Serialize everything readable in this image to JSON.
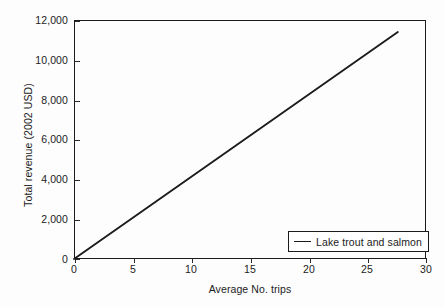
{
  "chart_data": {
    "type": "line",
    "title": "",
    "xlabel": "Average No. trips",
    "ylabel": "Total revenue (2002 USD)",
    "xlim": [
      0,
      30
    ],
    "ylim": [
      0,
      12000
    ],
    "xticks": [
      0,
      5,
      10,
      15,
      20,
      25,
      30
    ],
    "xtick_labels": [
      "0",
      "5",
      "10",
      "15",
      "20",
      "25",
      "30"
    ],
    "yticks": [
      0,
      2000,
      4000,
      6000,
      8000,
      10000,
      12000
    ],
    "ytick_labels": [
      "0",
      "2,000",
      "4,000",
      "6,000",
      "8,000",
      "10,000",
      "12,000"
    ],
    "grid": false,
    "legend_position": "lower right",
    "series": [
      {
        "name": "Lake trout and salmon",
        "color": "#1b1b1b",
        "x": [
          0,
          27.6
        ],
        "y": [
          0,
          11400
        ]
      }
    ]
  },
  "legend": {
    "entries": [
      {
        "label": "Lake trout and salmon"
      }
    ]
  }
}
